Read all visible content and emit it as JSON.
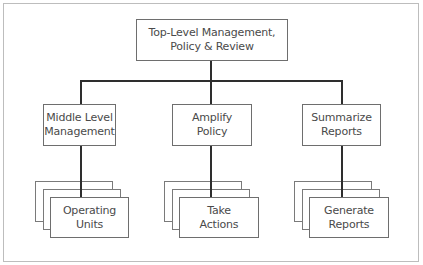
{
  "diagram": {
    "type": "org-chart",
    "root": {
      "label": "Top-Level Management,\nPolicy & Review"
    },
    "level2": [
      {
        "label": "Middle Level\nManagement"
      },
      {
        "label": "Amplify\nPolicy"
      },
      {
        "label": "Summarize\nReports"
      }
    ],
    "level3": [
      {
        "label": "Operating\nUnits",
        "stacked": true
      },
      {
        "label": "Take\nActions",
        "stacked": true
      },
      {
        "label": "Generate\nReports",
        "stacked": true
      }
    ],
    "colors": {
      "connector": "#2e2e2e",
      "box_border": "#6e6e6e",
      "frame_border": "#bdbdbd",
      "text": "#4a4a4a"
    }
  }
}
